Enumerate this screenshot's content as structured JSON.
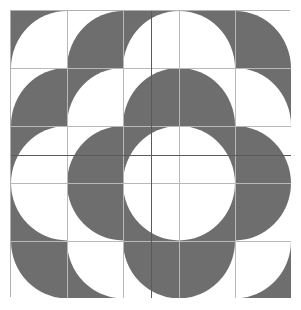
{
  "canvas": {
    "width": 301,
    "height": 310,
    "background_color": "#ffffff",
    "title": "Quarter-Circle Tile Pattern"
  },
  "pattern": {
    "name": "quarter-circle-tiling",
    "origin_x": 10,
    "origin_y": 10,
    "grid_width": 280,
    "grid_height": 287,
    "rows": 5,
    "cols": 5,
    "tile_width": 56,
    "tile_height": 57.4,
    "fill_color": "#6e6e6e",
    "empty_color": "#ffffff",
    "gridline_color": "#b9b9b9",
    "center_line_color": "#5a5a5a",
    "border_color": "#b0b0b0",
    "description": "5x5 grid of square tiles; each tile is a solid square with a quarter-circle of the opposite tone in one corner, mirrored about the horizontal and vertical center axes to form concentric rings of circles."
  },
  "chart_data": {
    "type": "heatmap",
    "xlabel": "",
    "ylabel": "",
    "categories": [
      "c0",
      "c1",
      "c2",
      "c3",
      "c4"
    ],
    "rows": [
      "r0",
      "r1",
      "r2",
      "r3",
      "r4"
    ],
    "legend": [
      "gray #6e6e6e",
      "white #ffffff"
    ],
    "tiles": [
      [
        {
          "bg": "gray",
          "arc": "white",
          "corner": "br"
        },
        {
          "bg": "white",
          "arc": "gray",
          "corner": "br"
        },
        {
          "bg": "gray",
          "arc": "white",
          "corner": "br"
        },
        {
          "bg": "gray",
          "arc": "white",
          "corner": "bl"
        },
        {
          "bg": "white",
          "arc": "gray",
          "corner": "bl"
        }
      ],
      [
        {
          "bg": "white",
          "arc": "gray",
          "corner": "br"
        },
        {
          "bg": "gray",
          "arc": "white",
          "corner": "br"
        },
        {
          "bg": "white",
          "arc": "gray",
          "corner": "br"
        },
        {
          "bg": "white",
          "arc": "gray",
          "corner": "bl"
        },
        {
          "bg": "gray",
          "arc": "white",
          "corner": "bl"
        }
      ],
      [
        {
          "bg": "gray",
          "arc": "white",
          "corner": "br"
        },
        {
          "bg": "white",
          "arc": "gray",
          "corner": "br"
        },
        {
          "bg": "gray",
          "arc": "white",
          "corner": "br"
        },
        {
          "bg": "gray",
          "arc": "white",
          "corner": "bl"
        },
        {
          "bg": "white",
          "arc": "gray",
          "corner": "bl"
        }
      ],
      [
        {
          "bg": "gray",
          "arc": "white",
          "corner": "tr"
        },
        {
          "bg": "white",
          "arc": "gray",
          "corner": "tr"
        },
        {
          "bg": "gray",
          "arc": "white",
          "corner": "tr"
        },
        {
          "bg": "gray",
          "arc": "white",
          "corner": "tl"
        },
        {
          "bg": "white",
          "arc": "gray",
          "corner": "tl"
        }
      ],
      [
        {
          "bg": "white",
          "arc": "gray",
          "corner": "tr"
        },
        {
          "bg": "gray",
          "arc": "white",
          "corner": "tr"
        },
        {
          "bg": "white",
          "arc": "gray",
          "corner": "tr"
        },
        {
          "bg": "white",
          "arc": "gray",
          "corner": "tl"
        },
        {
          "bg": "gray",
          "arc": "white",
          "corner": "tl"
        }
      ]
    ]
  }
}
